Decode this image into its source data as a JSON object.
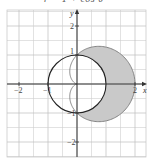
{
  "caption": "r = 1 + cos θ",
  "chart_data": {
    "type": "line",
    "title": "r = 1 + cos θ",
    "series": [
      {
        "name": "cardioid",
        "equation": "r = 1 + cos θ",
        "color": "#7a7a7a"
      },
      {
        "name": "circle",
        "equation": "r = 1",
        "color": "#222222"
      }
    ],
    "shaded_region": {
      "description": "inside r = 1 + cos θ, outside r = 1",
      "color": "#c9c9c9"
    },
    "xlabel": "x",
    "ylabel": "y",
    "xlim": [
      -2.4,
      2.4
    ],
    "ylim": [
      -2.5,
      2.55
    ],
    "x_ticks": [
      {
        "value": -2,
        "label": "−2"
      },
      {
        "value": -1,
        "label": "−1"
      },
      {
        "value": 2,
        "label": "2"
      }
    ],
    "y_ticks": [
      {
        "value": 2,
        "label": "2"
      },
      {
        "value": 1,
        "label": "1"
      },
      {
        "value": -1,
        "label": "−1"
      },
      {
        "value": -2,
        "label": "−2"
      }
    ],
    "grid": true,
    "grid_step": 0.5
  },
  "layout": {
    "origin_x": 77,
    "origin_y": 84,
    "unit_px": 29,
    "grid_left": 7,
    "grid_right": 146,
    "grid_top": 10,
    "grid_bottom": 157
  },
  "colors": {
    "shade": "#c9c9c9",
    "cardioid": "#7a7a7a",
    "circle": "#222222",
    "axis": "#333333"
  }
}
